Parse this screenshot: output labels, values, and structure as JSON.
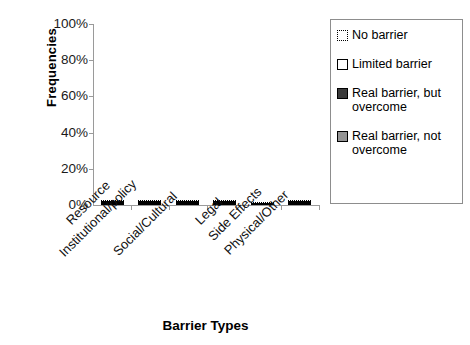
{
  "chart_data": {
    "type": "bar",
    "stacked": true,
    "title": "",
    "xlabel": "Barrier Types",
    "ylabel": "Frequencies",
    "categories": [
      "Resource",
      "Institutional/policy",
      "Social/Cultural",
      "Legal",
      "Side Effects",
      "Physical/Other"
    ],
    "ylim": [
      0,
      100
    ],
    "yticks": [
      "0%",
      "20%",
      "40%",
      "60%",
      "80%",
      "100%"
    ],
    "ytick_values": [
      0,
      20,
      40,
      60,
      80,
      100
    ],
    "grid": false,
    "legend_position": "right",
    "series": [
      {
        "name": "Real barrier, not overcome",
        "color": "#949494",
        "values": [
          18,
          11.5,
          10,
          10,
          0,
          11.5
        ]
      },
      {
        "name": "Real barrier, but overcome",
        "color": "#3b3b3b",
        "values": [
          42,
          35.5,
          37,
          24.5,
          23.5,
          19.5
        ]
      },
      {
        "name": "Limited barrier",
        "color": "#ffffff",
        "values": [
          11,
          19,
          13.5,
          8,
          18,
          8.5
        ]
      },
      {
        "name": "No barrier",
        "color": "#ffffff",
        "values": [
          29,
          34,
          39.5,
          57.5,
          58.5,
          60.5
        ]
      }
    ],
    "legend": [
      {
        "label": "No barrier",
        "swatch": "dotted-outline"
      },
      {
        "label": "Limited barrier",
        "swatch": "white-outline"
      },
      {
        "label": "Real barrier, but overcome",
        "swatch": "dark-fill"
      },
      {
        "label": "Real barrier, not overcome",
        "swatch": "gray-fill"
      }
    ]
  }
}
